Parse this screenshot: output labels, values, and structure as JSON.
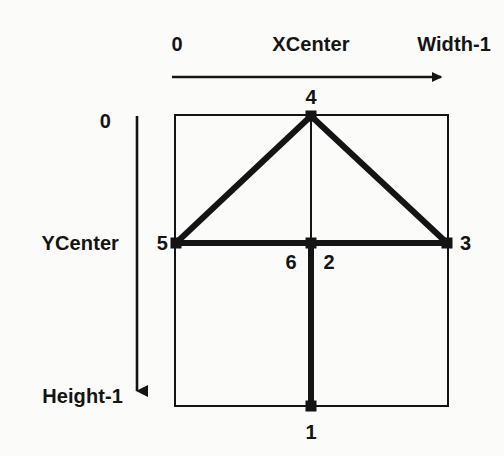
{
  "figure": {
    "type": "diagram",
    "background_color": "#fbfbf9",
    "ink_color": "#141414",
    "canvas": {
      "width": 504,
      "height": 456
    }
  },
  "axes": {
    "x_axis": {
      "name": "horizontal-axis",
      "direction": "left-to-right",
      "start_label": "0",
      "center_label": "XCenter",
      "end_label": "Width-1",
      "arrow": {
        "x1": 172,
        "y1": 77,
        "x2": 450,
        "y2": 77
      },
      "labels": [
        {
          "text": "0",
          "x": 177,
          "y": 45
        },
        {
          "text": "XCenter",
          "x": 311,
          "y": 45
        },
        {
          "text": "Width-1",
          "x": 449,
          "y": 45
        }
      ]
    },
    "y_axis": {
      "name": "vertical-axis",
      "direction": "top-to-bottom",
      "start_label": "0",
      "center_label": "YCenter",
      "end_label": "Height-1",
      "arrow": {
        "x1": 137,
        "y1": 116,
        "x2": 137,
        "y2": 402
      },
      "labels": [
        {
          "text": "0",
          "x": 110,
          "y": 122
        },
        {
          "text": "YCenter",
          "x": 118,
          "y": 243
        },
        {
          "text": "Height-1",
          "x": 122,
          "y": 396
        }
      ]
    }
  },
  "frame": {
    "name": "image-bounding-box",
    "x": 175,
    "y": 115,
    "width": 273,
    "height": 291,
    "stroke_width": 2
  },
  "nodes": [
    {
      "id": "1",
      "label": "1",
      "x": 311,
      "y": 406,
      "label_x": 311,
      "label_y": 432,
      "position": "bottom-center"
    },
    {
      "id": "2",
      "label": "2",
      "x": 311,
      "y": 243,
      "label_x": 329,
      "label_y": 262,
      "position": "center"
    },
    {
      "id": "3",
      "label": "3",
      "x": 447,
      "y": 243,
      "label_x": 466,
      "label_y": 243,
      "position": "right-center"
    },
    {
      "id": "4",
      "label": "4",
      "x": 311,
      "y": 116,
      "label_x": 311,
      "label_y": 97,
      "position": "top-center"
    },
    {
      "id": "5",
      "label": "5",
      "x": 176,
      "y": 243,
      "label_x": 162,
      "label_y": 243,
      "position": "left-center"
    },
    {
      "id": "6",
      "label": "6",
      "x": 311,
      "y": 243,
      "label_x": 291,
      "label_y": 262,
      "position": "center"
    }
  ],
  "edges": [
    {
      "name": "edge-5-to-4",
      "from": "5",
      "to": "4",
      "x1": 176,
      "y1": 243,
      "x2": 311,
      "y2": 116,
      "stroke_width": 6
    },
    {
      "name": "edge-4-to-3",
      "from": "4",
      "to": "3",
      "x1": 311,
      "y1": 116,
      "x2": 447,
      "y2": 243,
      "stroke_width": 6
    },
    {
      "name": "edge-5-to-3",
      "from": "5",
      "to": "3",
      "x1": 176,
      "y1": 243,
      "x2": 447,
      "y2": 243,
      "stroke_width": 6
    },
    {
      "name": "edge-2-to-1",
      "from": "2",
      "to": "1",
      "x1": 311,
      "y1": 243,
      "x2": 311,
      "y2": 406,
      "stroke_width": 6
    },
    {
      "name": "edge-4-to-6",
      "from": "4",
      "to": "6",
      "x1": 311,
      "y1": 116,
      "x2": 311,
      "y2": 243,
      "stroke_width": 2
    }
  ],
  "marker": {
    "name": "node-marker",
    "shape": "square",
    "size": 11,
    "fill": "#141414"
  }
}
